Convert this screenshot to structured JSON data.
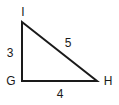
{
  "figure": {
    "type": "right-triangle-diagram",
    "background_color": "#ffffff",
    "stroke_color": "#1a1a1a",
    "stroke_width": 2,
    "vertices": [
      {
        "name": "I",
        "label": "I",
        "x": 22,
        "y": 22,
        "label_x": 23,
        "label_y": 12
      },
      {
        "name": "G",
        "label": "G",
        "x": 22,
        "y": 81,
        "label_x": 11,
        "label_y": 81
      },
      {
        "name": "H",
        "label": "H",
        "x": 97,
        "y": 81,
        "label_x": 108,
        "label_y": 81
      }
    ],
    "sides": [
      {
        "name": "left-leg",
        "from": "I",
        "to": "G",
        "label": "3",
        "label_x": 10,
        "label_y": 53
      },
      {
        "name": "hypotenuse",
        "from": "I",
        "to": "H",
        "label": "5",
        "label_x": 68,
        "label_y": 43
      },
      {
        "name": "base",
        "from": "G",
        "to": "H",
        "label": "4",
        "label_x": 60,
        "label_y": 94
      }
    ],
    "polygon_points": "22,22 22,81 97,81"
  }
}
